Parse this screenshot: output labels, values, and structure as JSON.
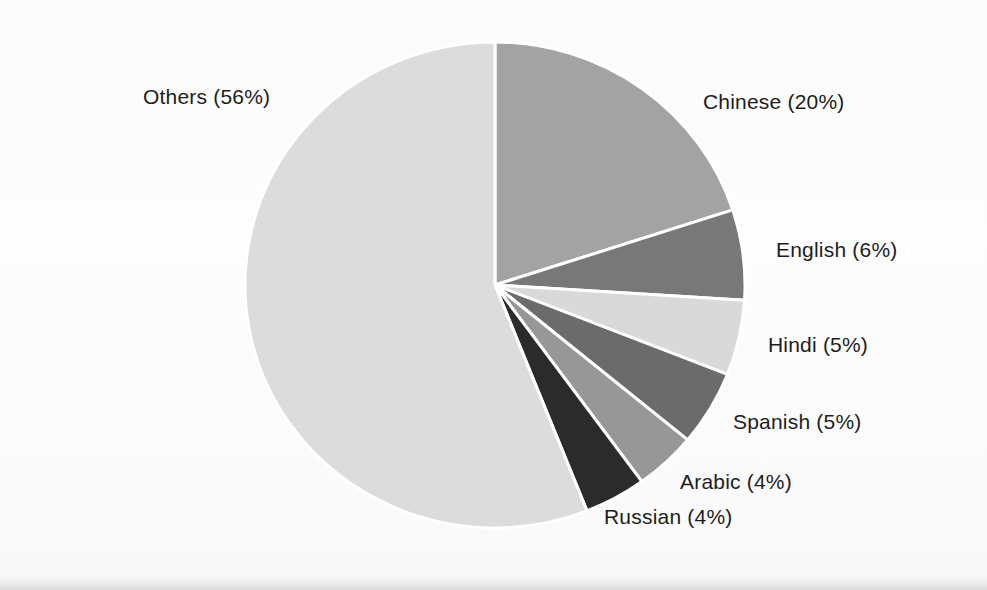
{
  "chart_data": {
    "type": "pie",
    "title": "",
    "subtitle": "",
    "xlabel": "",
    "ylabel": "",
    "legend_position": "none",
    "labels_position": "outside-callout",
    "grid": false,
    "unit": "%",
    "start_angle_deg": 0,
    "direction": "clockwise",
    "categories": [
      "Chinese",
      "English",
      "Hindi",
      "Spanish",
      "Arabic",
      "Russian",
      "Others"
    ],
    "values": [
      20,
      6,
      5,
      5,
      4,
      4,
      56
    ],
    "colors": [
      "#a3a3a3",
      "#787878",
      "#d9d9d9",
      "#6b6b6b",
      "#979797",
      "#2b2b2b",
      "#dcdcdc"
    ],
    "slices": [
      {
        "name": "Chinese",
        "value": 20,
        "label": "Chinese (20%)",
        "color": "#a3a3a3"
      },
      {
        "name": "English",
        "value": 6,
        "label": "English (6%)",
        "color": "#787878"
      },
      {
        "name": "Hindi",
        "value": 5,
        "label": "Hindi (5%)",
        "color": "#d9d9d9"
      },
      {
        "name": "Spanish",
        "value": 5,
        "label": "Spanish (5%)",
        "color": "#6b6b6b"
      },
      {
        "name": "Arabic",
        "value": 4,
        "label": "Arabic (4%)",
        "color": "#979797"
      },
      {
        "name": "Russian",
        "value": 4,
        "label": "Russian (4%)",
        "color": "#2b2b2b"
      },
      {
        "name": "Others",
        "value": 56,
        "label": "Others (56%)",
        "color": "#dcdcdc"
      }
    ],
    "separator_color": "#ffffff",
    "background_color": "#fdfdfd",
    "text_color": "#1d1d1d",
    "geometry": {
      "center_x": 495,
      "center_y": 285,
      "radius_x": 250,
      "radius_y": 243
    }
  },
  "labels": {
    "others": "Others (56%)",
    "chinese": "Chinese (20%)",
    "english": "English (6%)",
    "hindi": "Hindi (5%)",
    "spanish": "Spanish (5%)",
    "arabic": "Arabic (4%)",
    "russian": "Russian (4%)"
  }
}
